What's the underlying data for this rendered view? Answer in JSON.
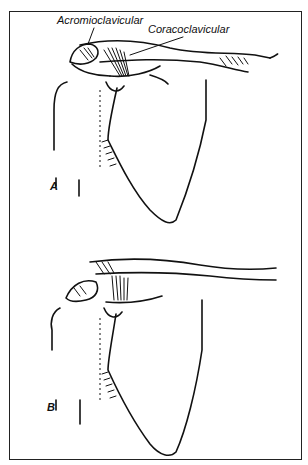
{
  "figure": {
    "labels": {
      "acromioclavicular": "Acromioclavicular",
      "coracoclavicular": "Coracoclavicular"
    },
    "panels": {
      "a": "A",
      "b": "B"
    },
    "colors": {
      "ink": "#111111",
      "background": "#ffffff",
      "frame": "#222222"
    }
  }
}
